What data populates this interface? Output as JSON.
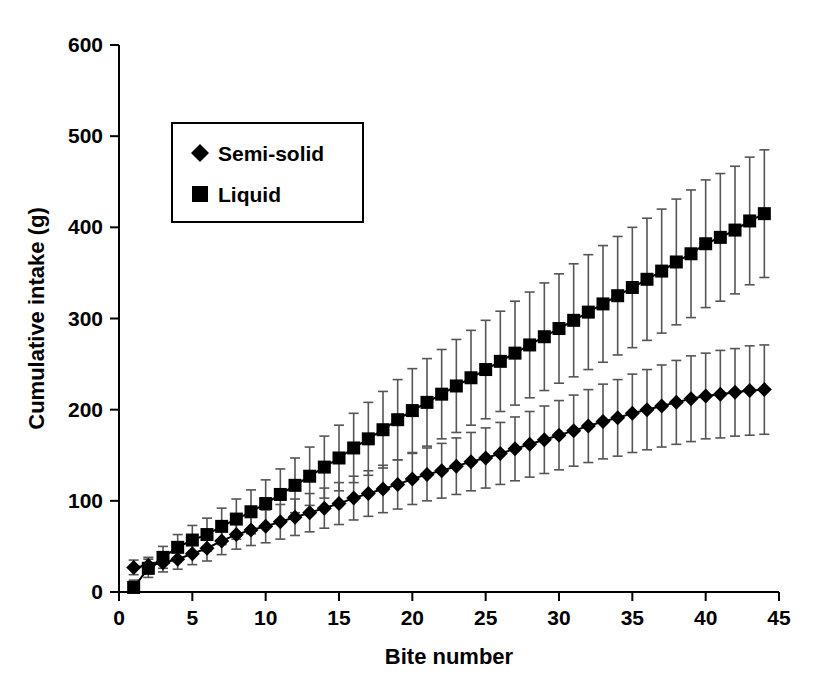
{
  "chart_data": {
    "type": "line",
    "title": "",
    "xlabel": "Bite number",
    "ylabel": "Cumulative intake (g)",
    "xlim": [
      0,
      45
    ],
    "ylim": [
      0,
      600
    ],
    "xticks": [
      0,
      5,
      10,
      15,
      20,
      25,
      30,
      35,
      40,
      45
    ],
    "yticks": [
      0,
      100,
      200,
      300,
      400,
      500,
      600
    ],
    "grid": false,
    "legend_position": "upper-left-inset",
    "legend": [
      "Semi-solid",
      "Liquid"
    ],
    "markers": {
      "Semi-solid": "diamond",
      "Liquid": "square"
    },
    "color": "#000000",
    "errorbars": "standard deviation",
    "x": [
      1,
      2,
      3,
      4,
      5,
      6,
      7,
      8,
      9,
      10,
      11,
      12,
      13,
      14,
      15,
      16,
      17,
      18,
      19,
      20,
      21,
      22,
      23,
      24,
      25,
      26,
      27,
      28,
      29,
      30,
      31,
      32,
      33,
      34,
      35,
      36,
      37,
      38,
      39,
      40,
      41,
      42,
      43,
      44
    ],
    "series": [
      {
        "name": "Semi-solid",
        "marker": "diamond",
        "values": [
          27,
          29,
          32,
          36,
          42,
          48,
          56,
          63,
          68,
          72,
          77,
          82,
          87,
          92,
          97,
          103,
          108,
          113,
          118,
          124,
          129,
          133,
          138,
          143,
          147,
          152,
          157,
          162,
          167,
          172,
          177,
          182,
          187,
          191,
          196,
          200,
          204,
          208,
          212,
          215,
          217,
          219,
          221,
          222
        ],
        "err": [
          8,
          9,
          10,
          11,
          12,
          14,
          15,
          16,
          17,
          18,
          19,
          20,
          21,
          22,
          23,
          24,
          25,
          26,
          27,
          28,
          29,
          30,
          31,
          32,
          33,
          34,
          35,
          36,
          37,
          38,
          39,
          40,
          41,
          42,
          43,
          44,
          45,
          46,
          47,
          47,
          48,
          48,
          49,
          49
        ]
      },
      {
        "name": "Liquid",
        "marker": "square",
        "values": [
          5,
          26,
          38,
          49,
          57,
          63,
          72,
          80,
          88,
          97,
          107,
          117,
          127,
          137,
          147,
          158,
          168,
          178,
          189,
          199,
          208,
          217,
          226,
          235,
          244,
          253,
          262,
          271,
          280,
          289,
          298,
          307,
          316,
          325,
          334,
          343,
          352,
          362,
          371,
          382,
          389,
          397,
          407,
          415
        ],
        "err": [
          8,
          10,
          12,
          14,
          16,
          18,
          20,
          22,
          24,
          26,
          28,
          30,
          32,
          34,
          36,
          38,
          40,
          42,
          44,
          46,
          48,
          49,
          51,
          52,
          54,
          55,
          57,
          58,
          59,
          60,
          62,
          63,
          64,
          65,
          66,
          67,
          68,
          69,
          70,
          70,
          70,
          70,
          70,
          70
        ]
      }
    ]
  },
  "axes": {
    "y_title": "Cumulative intake (g)",
    "x_title": "Bite number",
    "y_tick_labels": [
      "0",
      "100",
      "200",
      "300",
      "400",
      "500",
      "600"
    ],
    "x_tick_labels": [
      "0",
      "5",
      "10",
      "15",
      "20",
      "25",
      "30",
      "35",
      "40",
      "45"
    ]
  },
  "legend": {
    "items": [
      {
        "label": "Semi-solid",
        "marker": "diamond"
      },
      {
        "label": "Liquid",
        "marker": "square"
      }
    ]
  }
}
